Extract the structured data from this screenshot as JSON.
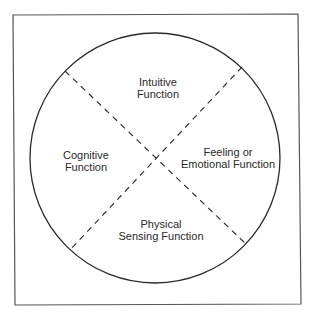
{
  "diagram": {
    "type": "quadrant-circle",
    "frame": {
      "stroke": "#555555"
    },
    "circle": {
      "cx": 155,
      "cy": 158,
      "r": 125,
      "stroke": "#2a2a2a"
    },
    "dividers": {
      "style": "dashed",
      "stroke": "#333333",
      "center": [
        157,
        158
      ]
    },
    "quadrants": [
      {
        "id": "top",
        "lines": [
          "Intuitive",
          "Function"
        ]
      },
      {
        "id": "left",
        "lines": [
          "Cognitive",
          "Function"
        ]
      },
      {
        "id": "right",
        "lines": [
          "Feeling or",
          "Emotional Function"
        ]
      },
      {
        "id": "bottom",
        "lines": [
          "Physical",
          "Sensing Function"
        ]
      }
    ]
  }
}
